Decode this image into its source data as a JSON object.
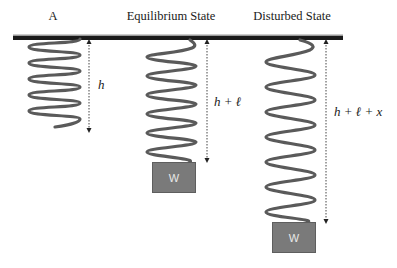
{
  "diagram": {
    "titles": {
      "a": "A",
      "equilibrium": "Equilibrium State",
      "disturbed": "Disturbed State"
    },
    "labels": {
      "a": "h",
      "equilibrium": "h + ℓ",
      "disturbed": "h + ℓ + x"
    },
    "weights": {
      "equilibrium": "W",
      "disturbed": "W"
    },
    "colors": {
      "ceiling": "#1a1a1a",
      "spring": "#5a5a5a",
      "weight_fill": "#7a7a7a",
      "weight_text": "#e8e8e8",
      "dimension_line": "#444444"
    },
    "springs": [
      {
        "name": "spring-a",
        "x_left": 29,
        "x_right": 80,
        "y_top": 38,
        "y_bottom": 128,
        "coils": 6
      },
      {
        "name": "spring-equilibrium",
        "x_left": 147,
        "x_right": 196,
        "y_top": 40,
        "y_bottom": 162,
        "coils": 6
      },
      {
        "name": "spring-disturbed",
        "x_left": 266,
        "x_right": 315,
        "y_top": 40,
        "y_bottom": 222,
        "coils": 6
      }
    ]
  }
}
